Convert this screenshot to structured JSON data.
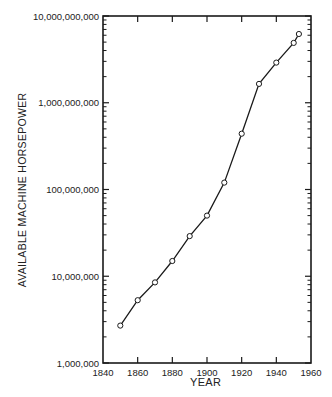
{
  "chart_data": {
    "type": "line",
    "title": "",
    "xlabel": "YEAR",
    "ylabel": "AVAILABLE MACHINE HORSEPOWER",
    "yscale": "log",
    "xlim": [
      1840,
      1960
    ],
    "ylim": [
      1000000,
      10000000000
    ],
    "xticks": [
      1840,
      1860,
      1880,
      1900,
      1920,
      1940,
      1960
    ],
    "xtick_labels": [
      "1840",
      "1860",
      "1880",
      "1900",
      "1920",
      "1940",
      "1960"
    ],
    "yticks": [
      1000000,
      10000000,
      100000000,
      1000000000,
      10000000000
    ],
    "ytick_labels": [
      "1,000,000",
      "10,000,000",
      "100,000,000",
      "1,000,000,000",
      "10,000,000,000"
    ],
    "grid": false,
    "legend": null,
    "markers": "open-circle",
    "series": [
      {
        "name": "Available machine horsepower",
        "x": [
          1850,
          1860,
          1870,
          1880,
          1890,
          1900,
          1910,
          1920,
          1930,
          1940,
          1950,
          1953
        ],
        "values": [
          2700000,
          5300000,
          8500000,
          15000000,
          29000000,
          50000000,
          120000000,
          440000000,
          1650000000,
          2900000000,
          4900000000,
          6200000000
        ]
      }
    ]
  },
  "labels": {
    "xlabel": "YEAR",
    "ylabel": "AVAILABLE MACHINE HORSEPOWER"
  },
  "colors": {
    "ink": "#1a1a1a",
    "background": "#ffffff"
  }
}
